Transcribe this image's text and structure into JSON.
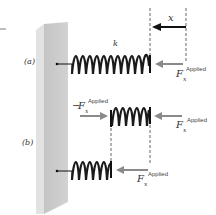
{
  "figure": {
    "parts": [
      {
        "id": "a",
        "label": "(a)"
      },
      {
        "id": "b",
        "label": "(b)"
      }
    ],
    "spring_constant_label": "k",
    "displacement_label": "x",
    "force_labels": {
      "a_right": {
        "prefix": "",
        "symbol": "F",
        "subscript": "x",
        "superscript": "Applied"
      },
      "b_top_left": {
        "prefix": "−",
        "symbol": "F",
        "subscript": "x",
        "superscript": "Applied"
      },
      "b_top_right": {
        "prefix": "",
        "symbol": "F",
        "subscript": "x",
        "superscript": "Applied"
      },
      "b_bottom": {
        "prefix": "",
        "symbol": "F",
        "subscript": "x",
        "superscript": "Applied"
      }
    },
    "colors": {
      "wall_front": "#c9c9c9",
      "wall_side": "#dedede",
      "spring": "#1a1a1a",
      "force_arrow": "#8a8a8a",
      "displacement_arrow": "#111111",
      "dashed": "#666666"
    }
  }
}
